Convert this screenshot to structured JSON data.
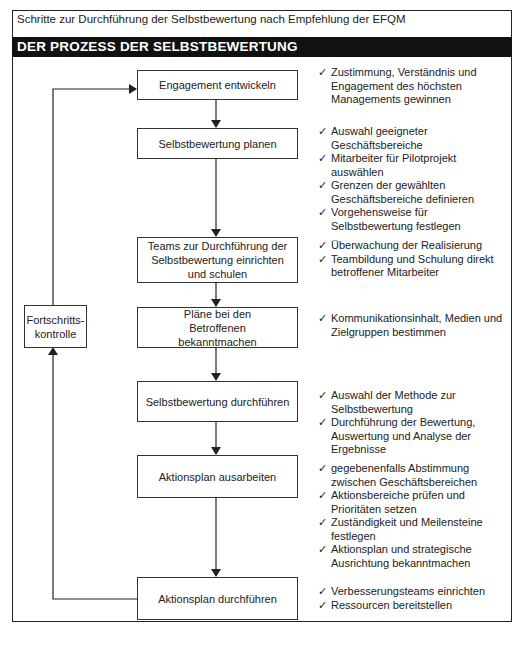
{
  "caption": "Schritte zur Durchführung der Selbstbewertung nach Empfehlung der EFQM",
  "header": "DER PROZESS DER SELBSTBEWERTUNG",
  "feedback_box": {
    "label": "Fortschritts-\nkontrolle",
    "line1": "Fortschritts-",
    "line2": "kontrolle"
  },
  "check_icon": "✓",
  "steps": [
    {
      "label": "Engagement entwickeln",
      "notes": [
        "Zustimmung, Verständnis und Engagement des höchsten Managements gewinnen"
      ]
    },
    {
      "label": "Selbstbewertung planen",
      "notes": [
        "Auswahl geeigneter Geschäftsbereiche",
        "Mitarbeiter für Pilotprojekt auswählen",
        "Grenzen der gewählten Geschäftsbereiche definieren",
        "Vorgehensweise für Selbstbewertung festlegen"
      ]
    },
    {
      "label": "Teams zur Durchführung der Selbstbewertung einrichten und schulen",
      "notes": [
        "Überwachung der Realisierung",
        "Teambildung und Schulung direkt betroffener Mitarbeiter"
      ]
    },
    {
      "label": "Pläne bei den Betroffenen bekanntmachen",
      "notes": [
        "Kommunikationsinhalt, Medien und Zielgruppen bestimmen"
      ]
    },
    {
      "label": "Selbstbewertung durchführen",
      "notes": [
        "Auswahl der Methode zur Selbstbewertung",
        "Durchführung der Bewertung, Auswertung und Analyse der Ergebnisse"
      ]
    },
    {
      "label": "Aktionsplan ausarbeiten",
      "notes": [
        "gegebenenfalls Abstimmung zwischen Geschäftsbereichen",
        "Aktionsbereiche prüfen und Prioritäten setzen",
        "Zuständigkeit und Meilensteine festlegen",
        "Aktionsplan und strategische Ausrichtung bekanntmachen"
      ]
    },
    {
      "label": "Aktionsplan durchführen",
      "notes": [
        "Verbesserungsteams einrichten",
        "Ressourcen bereitstellen"
      ]
    }
  ]
}
